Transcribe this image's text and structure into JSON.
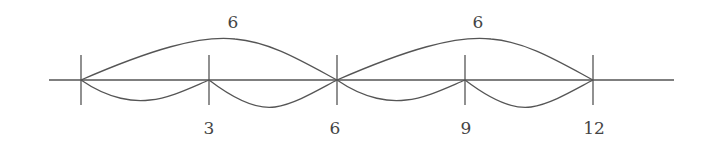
{
  "diagram": {
    "type": "number-line-jumps",
    "axis": {
      "x1": 49,
      "x2": 674,
      "y": 80
    },
    "ticks": [
      {
        "x": 81,
        "label": ""
      },
      {
        "x": 209,
        "label": "3"
      },
      {
        "x": 337,
        "label": "6"
      },
      {
        "x": 465,
        "label": "9"
      },
      {
        "x": 593,
        "label": "12"
      }
    ],
    "upper_jumps": [
      {
        "from": 0,
        "to": 6,
        "label": "6"
      },
      {
        "from": 6,
        "to": 12,
        "label": "6"
      }
    ],
    "lower_jumps": [
      {
        "from": 0,
        "to": 3
      },
      {
        "from": 3,
        "to": 6
      },
      {
        "from": 6,
        "to": 9
      },
      {
        "from": 9,
        "to": 12
      }
    ],
    "stroke_color": "#555555"
  }
}
